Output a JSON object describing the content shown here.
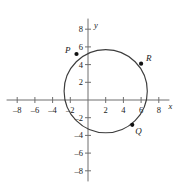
{
  "figure": {
    "kind": "coordinate-plane-circle-graph",
    "x_axis_label": "x",
    "y_axis_label": "y"
  },
  "chart_data": {
    "type": "scatter",
    "title": "",
    "subtitle": "",
    "xlabel": "x",
    "ylabel": "y",
    "xlim": [
      -9.2,
      9.2
    ],
    "ylim": [
      -9.2,
      9.2
    ],
    "grid": false,
    "legend": "none",
    "x_ticks": [
      -8,
      -6,
      -4,
      -2,
      2,
      4,
      6,
      8
    ],
    "y_ticks": [
      -8,
      -6,
      -4,
      -2,
      2,
      4,
      6,
      8
    ],
    "x_tick_labels": [
      "-8",
      "-6",
      "-4",
      "-2",
      "2",
      "4",
      "6",
      "8"
    ],
    "y_tick_labels": [
      "-8",
      "-6",
      "-4",
      "-2",
      "2",
      "4",
      "6",
      "8"
    ],
    "series": [
      {
        "name": "circle",
        "type": "circle",
        "center": [
          2,
          1
        ],
        "radius": 4.7,
        "values": []
      },
      {
        "name": "labeled points",
        "type": "scatter",
        "points": [
          {
            "label": "P",
            "x": -1.3,
            "y": 5.2
          },
          {
            "label": "R",
            "x": 6.0,
            "y": 4.1
          },
          {
            "label": "Q",
            "x": 5.0,
            "y": -2.8
          }
        ]
      }
    ],
    "annotations": [
      {
        "text": "P",
        "x": -1.3,
        "y": 5.2,
        "position": "left"
      },
      {
        "text": "R",
        "x": 6.0,
        "y": 4.1,
        "position": "right"
      },
      {
        "text": "Q",
        "x": 5.0,
        "y": -2.8,
        "position": "below-right"
      }
    ]
  },
  "colors": {
    "axis": "#6e6e6e",
    "curve": "#3d3d3d",
    "point": "#111111",
    "text": "#1a1a1a",
    "background": "#ffffff"
  }
}
